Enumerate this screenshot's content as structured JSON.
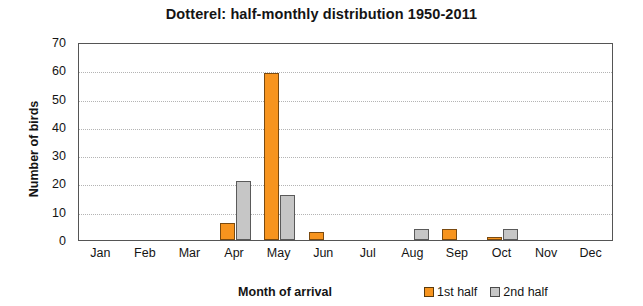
{
  "chart_data": {
    "type": "bar",
    "title": "Dotterel: half-monthly distribution 1950-2011",
    "xlabel": "Month of arrival",
    "ylabel": "Number of birds",
    "categories": [
      "Jan",
      "Feb",
      "Mar",
      "Apr",
      "May",
      "Jun",
      "Jul",
      "Aug",
      "Sep",
      "Oct",
      "Nov",
      "Dec"
    ],
    "series": [
      {
        "name": "1st half",
        "color": "#F7941E",
        "values": [
          0,
          0,
          0,
          6,
          59,
          3,
          0,
          0,
          4,
          1,
          0,
          0
        ]
      },
      {
        "name": "2nd half",
        "color": "#C6C6C6",
        "values": [
          0,
          0,
          0,
          21,
          16,
          0,
          0,
          4,
          0,
          4,
          0,
          0
        ]
      }
    ],
    "ylim": [
      0,
      70
    ],
    "yticks": [
      0,
      10,
      20,
      30,
      40,
      50,
      60,
      70
    ],
    "ytick_labels": [
      "0",
      "10",
      "20",
      "30",
      "40",
      "50",
      "60",
      "70"
    ],
    "grid": "horizontal-dotted",
    "legend_position": "bottom-right"
  },
  "legend": {
    "entries": [
      {
        "label": "1st half"
      },
      {
        "label": "2nd half"
      }
    ]
  }
}
